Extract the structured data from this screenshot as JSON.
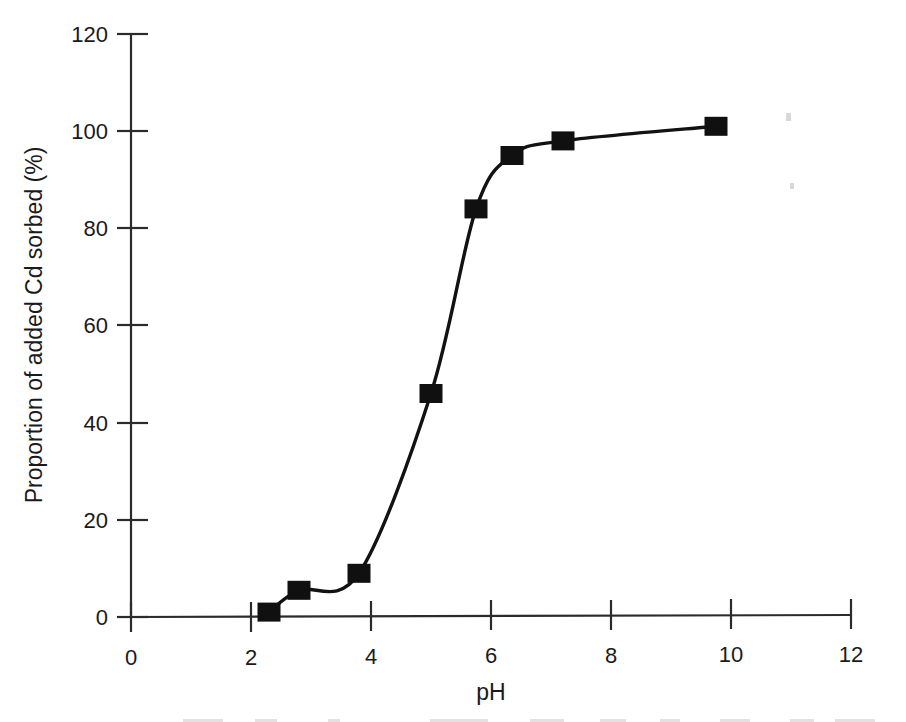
{
  "chart_data": {
    "type": "line",
    "title": "",
    "subtitle": "",
    "xlabel": "pH",
    "ylabel": "Proportion of added Cd sorbed (%)",
    "xlim": [
      0,
      12
    ],
    "ylim": [
      0,
      120
    ],
    "xticks": [
      0,
      2,
      4,
      6,
      8,
      10,
      12
    ],
    "yticks": [
      0,
      20,
      40,
      60,
      80,
      100,
      120
    ],
    "xtick_labels": [
      "0",
      "2",
      "4",
      "6",
      "8",
      "10",
      "12"
    ],
    "ytick_labels": [
      "0",
      "20",
      "40",
      "60",
      "80",
      "100",
      "120"
    ],
    "grid": false,
    "legend": null,
    "legend_position": "none",
    "marker": "filled-square",
    "marker_color": "#101010",
    "line_color": "#121212",
    "series": [
      {
        "name": "Cd sorption edge",
        "x": [
          2.3,
          2.8,
          3.8,
          5.0,
          5.75,
          6.35,
          7.2,
          9.75
        ],
        "y": [
          1,
          5.5,
          9,
          46,
          84,
          95,
          98,
          101
        ]
      }
    ],
    "annotations": []
  },
  "figure": {
    "background_color": "#ffffff",
    "axis_color": "#2b2b2b",
    "text_color": "#1a1a1a"
  }
}
